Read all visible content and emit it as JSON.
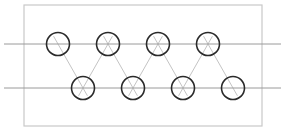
{
  "figure": {
    "title": "",
    "type": "lattice-graph-diagram",
    "canvas": {
      "width": 285,
      "height": 135,
      "background": "#ffffff"
    }
  },
  "colors": {
    "frame_stroke": "#c9c9c9",
    "row_line_stroke": "#9a9a9a",
    "diagonal_stroke": "#c4c4c4",
    "node_stroke": "#2a2a2a",
    "node_fill": "#ffffff"
  },
  "frame": {
    "x": 24,
    "y": 5,
    "width": 238,
    "height": 121,
    "stroke_width": 1.2
  },
  "rows": [
    {
      "name": "top-row",
      "y": 44,
      "line_x1": 4,
      "line_x2": 281,
      "stroke_width": 1.0
    },
    {
      "name": "bottom-row",
      "y": 88,
      "line_x1": 4,
      "line_x2": 281,
      "stroke_width": 1.0
    }
  ],
  "nodes": {
    "radius": 11.5,
    "stroke_width": 1.6,
    "top": [
      {
        "id": "t1",
        "label": "",
        "cx": 58,
        "cy": 44
      },
      {
        "id": "t2",
        "label": "",
        "cx": 108,
        "cy": 44
      },
      {
        "id": "t3",
        "label": "",
        "cx": 158,
        "cy": 44
      },
      {
        "id": "t4",
        "label": "",
        "cx": 208,
        "cy": 44
      }
    ],
    "bottom": [
      {
        "id": "b1",
        "label": "",
        "cx": 83,
        "cy": 88
      },
      {
        "id": "b2",
        "label": "",
        "cx": 133,
        "cy": 88
      },
      {
        "id": "b3",
        "label": "",
        "cx": 183,
        "cy": 88
      },
      {
        "id": "b4",
        "label": "",
        "cx": 233,
        "cy": 88
      }
    ]
  },
  "diagonals": {
    "stroke_width": 1.0,
    "extend": 9,
    "edges": [
      {
        "from": "t1",
        "to": "b1"
      },
      {
        "from": "t2",
        "to": "b1"
      },
      {
        "from": "t2",
        "to": "b2"
      },
      {
        "from": "t3",
        "to": "b2"
      },
      {
        "from": "t3",
        "to": "b3"
      },
      {
        "from": "t4",
        "to": "b3"
      },
      {
        "from": "t4",
        "to": "b4"
      }
    ]
  }
}
